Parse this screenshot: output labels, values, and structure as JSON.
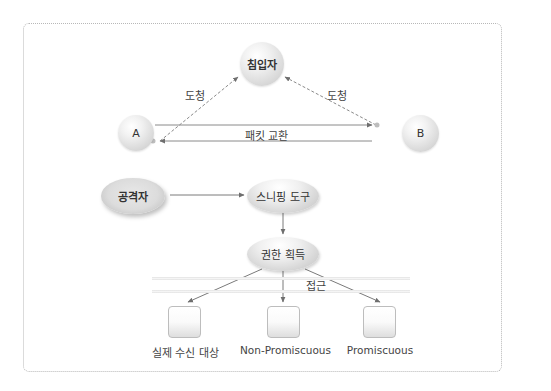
{
  "diagram": {
    "type": "sniffing-attack-diagram",
    "top_section": {
      "intruder": {
        "label": "침입자"
      },
      "host_a": {
        "label": "A"
      },
      "host_b": {
        "label": "B"
      },
      "eavesdrop_left": {
        "label": "도청"
      },
      "eavesdrop_right": {
        "label": "도청"
      },
      "packet_exchange": {
        "label": "패킷 교환"
      }
    },
    "flow": {
      "attacker": {
        "label": "공격자"
      },
      "sniffing_tool": {
        "label": "스니핑 도구"
      },
      "privilege_gain": {
        "label": "권한 획득"
      },
      "access": {
        "label": "접근"
      },
      "targets": [
        {
          "label": "실제 수신 대상"
        },
        {
          "label": "Non-Promiscuous"
        },
        {
          "label": "Promiscuous"
        }
      ]
    },
    "colors": {
      "line": "#7a7a7a",
      "dashed_line": "#8a8a8a",
      "frame_border": "#b8b8b8",
      "node_fill": "#e6e6e6"
    }
  }
}
